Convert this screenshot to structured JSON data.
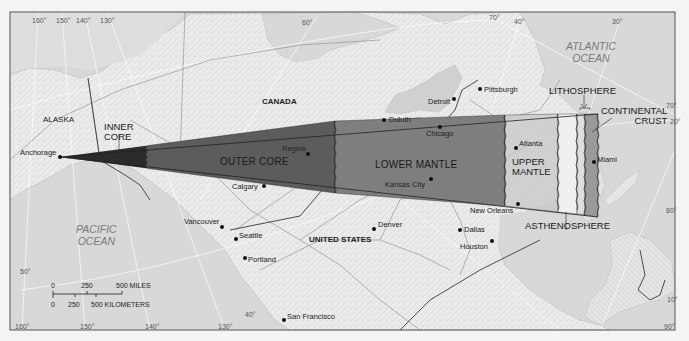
{
  "colors": {
    "water": "#d9d9d9",
    "land": "#ececec",
    "frame": "#555555",
    "inner_core": "#2b2b2b",
    "outer_core": "#5c5c5c",
    "lower_mantle": "#7e7e7e",
    "upper_mantle": "#c9c9c9",
    "asthenosphere": "#eeeeee",
    "lithosphere": "#dcdcdc",
    "continental_crust": "#9a9a9a"
  },
  "regions": {
    "alaska": "ALASKA",
    "canada": "CANADA",
    "united_states": "UNITED STATES"
  },
  "oceans": {
    "pacific": "PACIFIC\nOCEAN",
    "atlantic": "ATLANTIC\nOCEAN"
  },
  "layers": {
    "inner_core": "INNER\nCORE",
    "outer_core": "OUTER CORE",
    "lower_mantle": "LOWER MANTLE",
    "upper_mantle": "UPPER\nMANTLE",
    "asthenosphere": "ASTHENOSPHERE",
    "lithosphere": "LITHOSPHERE",
    "continental_crust": "CONTINENTAL\nCRUST"
  },
  "cities": [
    {
      "name": "Anchorage",
      "x": 60,
      "y": 157,
      "lx": 20,
      "ly": 149
    },
    {
      "name": "Duluth",
      "x": 384,
      "y": 120,
      "lx": 389,
      "ly": 116
    },
    {
      "name": "Detroit",
      "x": 454,
      "y": 99,
      "lx": 428,
      "ly": 98
    },
    {
      "name": "Pittsburgh",
      "x": 480,
      "y": 89,
      "lx": 484,
      "ly": 86
    },
    {
      "name": "Chicago",
      "x": 440,
      "y": 127,
      "lx": 426,
      "ly": 130
    },
    {
      "name": "Regina",
      "x": 308,
      "y": 154,
      "lx": 282,
      "ly": 145
    },
    {
      "name": "Calgary",
      "x": 264,
      "y": 186,
      "lx": 232,
      "ly": 183
    },
    {
      "name": "Kansas City",
      "x": 431,
      "y": 179,
      "lx": 385,
      "ly": 181
    },
    {
      "name": "Atlanta",
      "x": 516,
      "y": 148,
      "lx": 519,
      "ly": 140
    },
    {
      "name": "Miami",
      "x": 594,
      "y": 162,
      "lx": 597,
      "ly": 156
    },
    {
      "name": "New Orleans",
      "x": 518,
      "y": 204,
      "lx": 470,
      "ly": 207
    },
    {
      "name": "Dallas",
      "x": 460,
      "y": 230,
      "lx": 464,
      "ly": 226
    },
    {
      "name": "Houston",
      "x": 492,
      "y": 241,
      "lx": 460,
      "ly": 243
    },
    {
      "name": "Denver",
      "x": 374,
      "y": 229,
      "lx": 378,
      "ly": 221
    },
    {
      "name": "Vancouver",
      "x": 222,
      "y": 227,
      "lx": 184,
      "ly": 218
    },
    {
      "name": "Seattle",
      "x": 236,
      "y": 239,
      "lx": 239,
      "ly": 232
    },
    {
      "name": "Portland",
      "x": 245,
      "y": 258,
      "lx": 248,
      "ly": 256
    },
    {
      "name": "San Francisco",
      "x": 284,
      "y": 320,
      "lx": 287,
      "ly": 313
    }
  ],
  "degree_labels": [
    {
      "text": "160°",
      "x": 32,
      "y": 17
    },
    {
      "text": "150°",
      "x": 56,
      "y": 17
    },
    {
      "text": "140°",
      "x": 76,
      "y": 17
    },
    {
      "text": "130°",
      "x": 100,
      "y": 17
    },
    {
      "text": "60°",
      "x": 302,
      "y": 19
    },
    {
      "text": "70°",
      "x": 489,
      "y": 14
    },
    {
      "text": "40°",
      "x": 514,
      "y": 18
    },
    {
      "text": "30°",
      "x": 612,
      "y": 18
    },
    {
      "text": "70°",
      "x": 666,
      "y": 102
    },
    {
      "text": "20°",
      "x": 670,
      "y": 118
    },
    {
      "text": "80°",
      "x": 666,
      "y": 207
    },
    {
      "text": "10°",
      "x": 667,
      "y": 296
    },
    {
      "text": "90°",
      "x": 664,
      "y": 323
    },
    {
      "text": "50°",
      "x": 20,
      "y": 268
    },
    {
      "text": "160°",
      "x": 15,
      "y": 323
    },
    {
      "text": "150°",
      "x": 80,
      "y": 323
    },
    {
      "text": "140°",
      "x": 145,
      "y": 323
    },
    {
      "text": "130°",
      "x": 218,
      "y": 323
    },
    {
      "text": "40°",
      "x": 245,
      "y": 311
    }
  ],
  "scale_bar": {
    "miles": [
      "0",
      "250",
      "500 MILES"
    ],
    "kilometers": [
      "0",
      "250",
      "500 KILOMETERS"
    ]
  }
}
